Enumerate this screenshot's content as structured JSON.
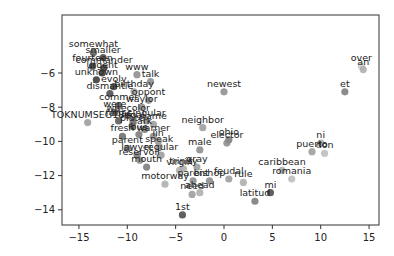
{
  "chart_data": {
    "type": "scatter",
    "title": "",
    "xlabel": "",
    "ylabel": "",
    "xlim": [
      -16.2,
      16.2
    ],
    "ylim": [
      -15.0,
      -4.6
    ],
    "xticks": [
      -15,
      -10,
      -5,
      0,
      5,
      10,
      15
    ],
    "yticks": [
      -6,
      -8,
      -10,
      -12,
      -14
    ],
    "grid": false,
    "legend": null,
    "points": [
      {
        "label": "somewhat",
        "x": -13.5,
        "y": -4.8,
        "shade": "#555555"
      },
      {
        "label": "smaller",
        "x": -12.5,
        "y": -5.1,
        "shade": "#444444"
      },
      {
        "label": "fourteen",
        "x": -13.6,
        "y": -5.6,
        "shade": "#333333"
      },
      {
        "label": "commander",
        "x": -12.4,
        "y": -5.7,
        "shade": "#333333"
      },
      {
        "label": "urgent",
        "x": -12.6,
        "y": -6.0,
        "shade": "#333333"
      },
      {
        "label": "unknown",
        "x": -13.2,
        "y": -6.4,
        "shade": "#333333"
      },
      {
        "label": "www",
        "x": -9.0,
        "y": -6.1,
        "shade": "#888888"
      },
      {
        "label": "talk",
        "x": -7.6,
        "y": -6.5,
        "shade": "#888888"
      },
      {
        "label": "evolv",
        "x": -11.4,
        "y": -6.8,
        "shade": "#444444"
      },
      {
        "label": "dismantle",
        "x": -11.8,
        "y": -7.2,
        "shade": "#444444"
      },
      {
        "label": "birthday",
        "x": -9.3,
        "y": -7.1,
        "shade": "#999999"
      },
      {
        "label": "oppont",
        "x": -7.8,
        "y": -7.6,
        "shade": "#888888"
      },
      {
        "label": "commer",
        "x": -10.9,
        "y": -7.9,
        "shade": "#555555"
      },
      {
        "label": "waylor",
        "x": -8.5,
        "y": -8.0,
        "shade": "#888888"
      },
      {
        "label": "were",
        "x": -11.3,
        "y": -8.3,
        "shade": "#555555"
      },
      {
        "label": "wirecolor",
        "x": -9.9,
        "y": -8.5,
        "shade": "#666666"
      },
      {
        "label": "TOKNUMSEG18",
        "x": -14.1,
        "y": -8.9,
        "shade": "#999999"
      },
      {
        "label": "fedac",
        "x": -10.9,
        "y": -8.8,
        "shade": "#555555"
      },
      {
        "label": "legal",
        "x": -9.4,
        "y": -8.9,
        "shade": "#666666"
      },
      {
        "label": "singular",
        "x": -8.0,
        "y": -8.8,
        "shade": "#888888"
      },
      {
        "label": "name",
        "x": -7.3,
        "y": -9.0,
        "shade": "#999999"
      },
      {
        "label": "plate",
        "x": -9.5,
        "y": -9.1,
        "shade": "#666666"
      },
      {
        "label": "ark",
        "x": -8.2,
        "y": -9.3,
        "shade": "#777777"
      },
      {
        "label": "newest",
        "x": 0.0,
        "y": -7.1,
        "shade": "#888888"
      },
      {
        "label": "neighbor",
        "x": -2.2,
        "y": -9.2,
        "shade": "#999999"
      },
      {
        "label": "fresh",
        "x": -10.5,
        "y": -9.7,
        "shade": "#666666"
      },
      {
        "label": "bus",
        "x": -8.8,
        "y": -9.6,
        "shade": "#777777"
      },
      {
        "label": "warner",
        "x": -7.3,
        "y": -9.7,
        "shade": "#888888"
      },
      {
        "label": "lin",
        "x": -6.8,
        "y": -10.0,
        "shade": "#999999"
      },
      {
        "label": "ohio",
        "x": 0.5,
        "y": -9.9,
        "shade": "#777777"
      },
      {
        "label": "elector",
        "x": 0.3,
        "y": -10.1,
        "shade": "#888888"
      },
      {
        "label": "male",
        "x": -2.5,
        "y": -10.5,
        "shade": "#888888"
      },
      {
        "label": "parent",
        "x": -10.0,
        "y": -10.4,
        "shade": "#777777"
      },
      {
        "label": "speak",
        "x": -6.7,
        "y": -10.3,
        "shade": "#999999"
      },
      {
        "label": "lawyer",
        "x": -9.0,
        "y": -10.8,
        "shade": "#777777"
      },
      {
        "label": "regular",
        "x": -6.5,
        "y": -10.8,
        "shade": "#999999"
      },
      {
        "label": "reservoir",
        "x": -8.7,
        "y": -11.1,
        "shade": "#888888"
      },
      {
        "label": "gray",
        "x": -2.8,
        "y": -11.5,
        "shade": "#999999"
      },
      {
        "label": "mouth",
        "x": -8.0,
        "y": -11.5,
        "shade": "#777777"
      },
      {
        "label": "virgin",
        "x": -4.6,
        "y": -11.7,
        "shade": "#aaaaaa"
      },
      {
        "label": "trinity",
        "x": -4.2,
        "y": -11.6,
        "shade": "#aaaaaa"
      },
      {
        "label": "motorway",
        "x": -6.1,
        "y": -12.5,
        "shade": "#aaaaaa"
      },
      {
        "label": "parent2",
        "x": -3.2,
        "y": -12.3,
        "shade": "#888888"
      },
      {
        "label": "bishop",
        "x": -1.5,
        "y": -12.3,
        "shade": "#888888"
      },
      {
        "label": "feudal",
        "x": 0.5,
        "y": -12.2,
        "shade": "#999999"
      },
      {
        "label": "rule",
        "x": 2.0,
        "y": -12.4,
        "shade": "#aaaaaa"
      },
      {
        "label": "ahead",
        "x": -2.5,
        "y": -13.0,
        "shade": "#aaaaaa"
      },
      {
        "label": "need",
        "x": -3.3,
        "y": -13.1,
        "shade": "#999999"
      },
      {
        "label": "caribbean",
        "x": 6.0,
        "y": -11.7,
        "shade": "#aaaaaa"
      },
      {
        "label": "romania",
        "x": 7.0,
        "y": -12.2,
        "shade": "#bbbbbb"
      },
      {
        "label": "latitud",
        "x": 3.2,
        "y": -13.5,
        "shade": "#777777"
      },
      {
        "label": "mi",
        "x": 4.8,
        "y": -13.0,
        "shade": "#444444"
      },
      {
        "label": "1st",
        "x": -4.3,
        "y": -14.3,
        "shade": "#444444"
      },
      {
        "label": "over",
        "x": 14.2,
        "y": -5.6,
        "shade": "#cccccc"
      },
      {
        "label": "an",
        "x": 14.4,
        "y": -5.8,
        "shade": "#aaaaaa"
      },
      {
        "label": "et",
        "x": 12.5,
        "y": -7.1,
        "shade": "#777777"
      },
      {
        "label": "ni",
        "x": 10.0,
        "y": -10.1,
        "shade": "#aaaaaa"
      },
      {
        "label": "puerto",
        "x": 9.1,
        "y": -10.6,
        "shade": "#999999"
      },
      {
        "label": "don",
        "x": 10.4,
        "y": -10.7,
        "shade": "#bbbbbb"
      }
    ]
  }
}
